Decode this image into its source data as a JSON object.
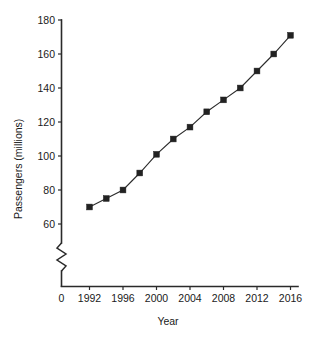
{
  "chart_data": {
    "type": "line",
    "title": "",
    "subtitle": "",
    "xlabel": "Year",
    "ylabel": "Passengers (millions)",
    "x": [
      1992,
      1994,
      1996,
      1998,
      2000,
      2002,
      2004,
      2006,
      2008,
      2010,
      2012,
      2014,
      2016
    ],
    "values": [
      70,
      75,
      80,
      90,
      101,
      110,
      117,
      126,
      133,
      140,
      150,
      160,
      171
    ],
    "series": [
      {
        "name": "Passengers",
        "values": [
          70,
          75,
          80,
          90,
          101,
          110,
          117,
          126,
          133,
          140,
          150,
          160,
          171
        ]
      }
    ],
    "xtick_labels": [
      "0",
      "1992",
      "1996",
      "2000",
      "2004",
      "2008",
      "2012",
      "2016"
    ],
    "ytick_labels": [
      "60",
      "80",
      "100",
      "120",
      "140",
      "160",
      "180"
    ],
    "ytick_values": [
      60,
      80,
      100,
      120,
      140,
      160,
      180
    ],
    "xlim": [
      1991,
      2017
    ],
    "ylim": [
      60,
      180
    ],
    "y_axis_break": true,
    "y_axis_break_symbol": "zigzag",
    "grid": false,
    "legend": false,
    "legend_position": "none",
    "marker": "square",
    "marker_color": "#222222",
    "line_color": "#2b2b2b",
    "background_color": "#ffffff"
  }
}
